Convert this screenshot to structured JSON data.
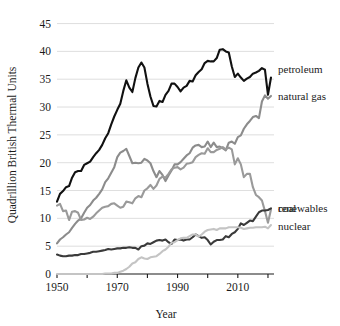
{
  "chart_data": {
    "type": "line",
    "title": "",
    "xlabel": "Year",
    "ylabel": "Quadrillion British Thermal Units",
    "xlim": [
      1950,
      2022
    ],
    "ylim": [
      0,
      46
    ],
    "grid": true,
    "legend_position": "right-inline-labels",
    "xticks": [
      1950,
      1970,
      1990,
      2010
    ],
    "xtick_labels": [
      "1950",
      "1970",
      "1990",
      "2010"
    ],
    "xminor_ticks": [
      1960,
      1980,
      2000,
      2020
    ],
    "yticks": [
      0,
      5,
      10,
      15,
      20,
      25,
      30,
      35,
      40,
      45
    ],
    "ytick_labels": [
      "0",
      "5",
      "10",
      "15",
      "20",
      "25",
      "30",
      "35",
      "40",
      "45"
    ],
    "x": [
      1950,
      1951,
      1952,
      1953,
      1954,
      1955,
      1956,
      1957,
      1958,
      1959,
      1960,
      1961,
      1962,
      1963,
      1964,
      1965,
      1966,
      1967,
      1968,
      1969,
      1970,
      1971,
      1972,
      1973,
      1974,
      1975,
      1976,
      1977,
      1978,
      1979,
      1980,
      1981,
      1982,
      1983,
      1984,
      1985,
      1986,
      1987,
      1988,
      1989,
      1990,
      1991,
      1992,
      1993,
      1994,
      1995,
      1996,
      1997,
      1998,
      1999,
      2000,
      2001,
      2002,
      2003,
      2004,
      2005,
      2006,
      2007,
      2008,
      2009,
      2010,
      2011,
      2012,
      2013,
      2014,
      2015,
      2016,
      2017,
      2018,
      2019,
      2020,
      2021
    ],
    "series": [
      {
        "name": "petroleum",
        "color": "#111111",
        "label_value": 36.8,
        "values": [
          13.0,
          14.4,
          14.9,
          15.6,
          15.8,
          17.3,
          18.3,
          18.5,
          18.5,
          19.6,
          19.9,
          20.2,
          21.0,
          21.7,
          22.3,
          23.2,
          24.4,
          25.3,
          26.9,
          28.3,
          29.5,
          30.6,
          32.9,
          34.8,
          33.5,
          32.7,
          35.2,
          37.1,
          38.0,
          37.1,
          34.2,
          31.9,
          30.2,
          30.1,
          31.1,
          30.9,
          32.2,
          32.9,
          34.2,
          34.2,
          33.6,
          32.8,
          33.5,
          33.8,
          34.7,
          34.6,
          35.7,
          36.3,
          36.8,
          37.9,
          38.3,
          38.2,
          38.2,
          38.8,
          40.3,
          40.4,
          40.0,
          39.8,
          37.3,
          35.4,
          36.0,
          35.3,
          34.7,
          35.1,
          35.4,
          36.0,
          36.2,
          36.5,
          37.0,
          36.7,
          32.2,
          35.3
        ]
      },
      {
        "name": "natural gas",
        "color": "#8c8c8c",
        "label_value": 32.0,
        "values": [
          5.5,
          6.2,
          6.6,
          7.1,
          7.5,
          8.3,
          9.0,
          9.6,
          10.0,
          11.0,
          11.9,
          12.4,
          13.2,
          13.7,
          14.4,
          15.2,
          16.5,
          17.2,
          18.2,
          19.2,
          21.0,
          21.8,
          22.1,
          22.5,
          21.2,
          19.9,
          20.0,
          19.9,
          20.0,
          20.7,
          20.4,
          19.9,
          18.5,
          17.4,
          18.5,
          17.8,
          16.7,
          17.7,
          18.6,
          19.7,
          19.7,
          20.1,
          20.7,
          21.3,
          21.7,
          22.7,
          23.1,
          23.2,
          22.8,
          22.9,
          23.8,
          22.8,
          23.6,
          22.8,
          22.9,
          22.6,
          22.2,
          23.6,
          23.8,
          23.4,
          24.6,
          24.9,
          26.1,
          26.9,
          27.5,
          28.2,
          28.4,
          28.0,
          31.0,
          32.1,
          31.5,
          32.0
        ]
      },
      {
        "name": "coal",
        "color": "#9a9a9a",
        "label_value": 11.6,
        "values": [
          12.3,
          12.6,
          11.3,
          11.4,
          9.7,
          11.2,
          11.3,
          11.0,
          9.7,
          9.8,
          10.1,
          9.9,
          10.3,
          10.9,
          11.4,
          11.9,
          12.1,
          12.2,
          12.6,
          12.7,
          12.3,
          11.9,
          12.1,
          13.0,
          12.9,
          12.7,
          13.6,
          14.0,
          13.8,
          15.0,
          15.4,
          16.0,
          15.3,
          15.9,
          17.1,
          17.5,
          17.3,
          18.0,
          18.8,
          19.1,
          19.2,
          18.8,
          19.1,
          19.8,
          19.9,
          20.1,
          21.0,
          21.4,
          21.7,
          21.6,
          22.6,
          21.9,
          21.9,
          22.3,
          22.5,
          22.8,
          22.4,
          22.7,
          22.4,
          19.7,
          20.8,
          19.7,
          17.4,
          18.0,
          18.0,
          15.6,
          14.2,
          13.8,
          13.2,
          11.3,
          9.2,
          11.6
        ]
      },
      {
        "name": "renewables",
        "color": "#3a3a3a",
        "label_value": 11.8,
        "values": [
          3.5,
          3.3,
          3.2,
          3.2,
          3.3,
          3.3,
          3.4,
          3.4,
          3.6,
          3.6,
          3.7,
          3.8,
          4.0,
          4.0,
          4.1,
          4.2,
          4.3,
          4.5,
          4.4,
          4.5,
          4.6,
          4.6,
          4.7,
          4.7,
          4.8,
          4.7,
          4.7,
          4.4,
          5.0,
          5.1,
          5.5,
          5.4,
          5.7,
          6.0,
          6.1,
          6.0,
          6.2,
          5.7,
          5.4,
          6.2,
          6.1,
          6.2,
          6.0,
          6.2,
          6.2,
          6.6,
          7.1,
          6.8,
          6.5,
          6.6,
          6.1,
          5.3,
          5.8,
          6.1,
          6.1,
          6.2,
          6.8,
          6.6,
          7.2,
          7.5,
          8.1,
          9.1,
          8.8,
          9.2,
          9.6,
          9.5,
          10.3,
          11.1,
          11.4,
          11.4,
          11.5,
          11.8
        ]
      },
      {
        "name": "nuclear",
        "color": "#c4c4c4",
        "label_value": 8.8,
        "values": [
          0.0,
          0.0,
          0.0,
          0.0,
          0.0,
          0.0,
          0.0,
          0.0,
          0.0,
          0.0,
          0.0,
          0.0,
          0.0,
          0.0,
          0.0,
          0.0,
          0.1,
          0.1,
          0.1,
          0.2,
          0.2,
          0.4,
          0.6,
          0.9,
          1.3,
          1.9,
          2.1,
          2.7,
          3.0,
          2.8,
          2.7,
          3.0,
          3.1,
          3.2,
          3.6,
          4.1,
          4.4,
          4.9,
          5.6,
          5.7,
          6.1,
          6.4,
          6.5,
          6.5,
          6.8,
          7.1,
          7.1,
          6.7,
          7.1,
          7.6,
          7.9,
          8.0,
          8.1,
          7.9,
          8.2,
          8.2,
          8.2,
          8.4,
          8.4,
          8.4,
          8.4,
          8.3,
          8.1,
          8.2,
          8.3,
          8.3,
          8.4,
          8.4,
          8.4,
          8.5,
          8.2,
          8.8
        ]
      }
    ]
  },
  "axis": {
    "ylabel": "Quadrillion British Thermal Units",
    "xlabel": "Year"
  }
}
